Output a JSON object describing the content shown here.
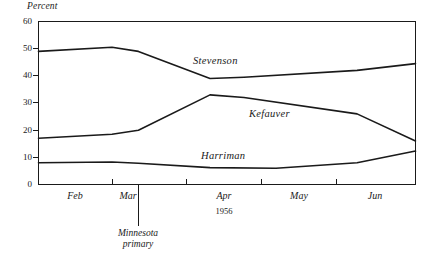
{
  "chart_data": {
    "type": "line",
    "title": "",
    "ylabel": "Percent",
    "xlabel": "1956",
    "ylim": [
      0,
      60
    ],
    "yticks": [
      0,
      10,
      20,
      30,
      40,
      50,
      60
    ],
    "grid": false,
    "legend_position": "inline-labels",
    "categories": [
      "Feb",
      "Mar",
      "Apr",
      "May",
      "Jun"
    ],
    "x_tick_labels": [
      "Feb",
      "Mar",
      "Apr",
      "May",
      "Jun"
    ],
    "annotations": [
      {
        "label": "Minnesota primary",
        "line1": "Minnesota",
        "line2": "primary",
        "x_fraction": 0.265
      }
    ],
    "series": [
      {
        "name": "Stevenson",
        "label": "Stevenson",
        "points": [
          {
            "x": 0.0,
            "y": 49
          },
          {
            "x": 0.195,
            "y": 50.5
          },
          {
            "x": 0.265,
            "y": 49
          },
          {
            "x": 0.455,
            "y": 39
          },
          {
            "x": 0.545,
            "y": 39.5
          },
          {
            "x": 0.845,
            "y": 42
          },
          {
            "x": 1.0,
            "y": 44.5
          }
        ]
      },
      {
        "name": "Kefauver",
        "label": "Kefauver",
        "points": [
          {
            "x": 0.0,
            "y": 17
          },
          {
            "x": 0.195,
            "y": 18.5
          },
          {
            "x": 0.265,
            "y": 20
          },
          {
            "x": 0.455,
            "y": 33
          },
          {
            "x": 0.545,
            "y": 32
          },
          {
            "x": 0.845,
            "y": 26
          },
          {
            "x": 1.0,
            "y": 16
          }
        ]
      },
      {
        "name": "Harriman",
        "label": "Harriman",
        "points": [
          {
            "x": 0.0,
            "y": 8
          },
          {
            "x": 0.195,
            "y": 8.3
          },
          {
            "x": 0.265,
            "y": 7.8
          },
          {
            "x": 0.455,
            "y": 6.2
          },
          {
            "x": 0.63,
            "y": 6.0
          },
          {
            "x": 0.845,
            "y": 8
          },
          {
            "x": 1.0,
            "y": 12.3
          }
        ]
      }
    ]
  },
  "plot": {
    "axis_color": "#1a1a1a",
    "line_color": "#1a1a1a"
  },
  "series_labels": [
    {
      "name": "Stevenson",
      "text": "Stevenson",
      "left": 193,
      "top": 55
    },
    {
      "name": "Kefauver",
      "text": "Kefauver",
      "left": 249,
      "top": 108
    },
    {
      "name": "Harriman",
      "text": "Harriman",
      "left": 201,
      "top": 150
    }
  ],
  "y_axis": {
    "label": "Percent",
    "ticks": [
      "60",
      "50",
      "40",
      "30",
      "20",
      "10",
      "0"
    ]
  },
  "x_axis": {
    "year": "1956",
    "ticks": [
      "Feb",
      "Mar",
      "Apr",
      "May",
      "Jun"
    ]
  },
  "annotation": {
    "line1": "Minnesota",
    "line2": "primary"
  }
}
